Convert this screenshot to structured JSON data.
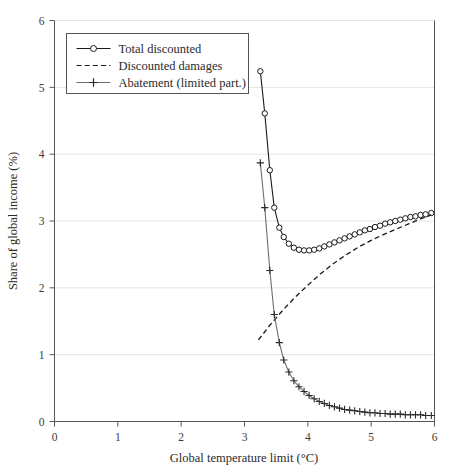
{
  "chart_data": {
    "type": "line",
    "title": "",
    "xlabel": "Global temperature limit (°C)",
    "ylabel": "Share of global income (%)",
    "xlim": [
      0,
      6
    ],
    "ylim": [
      0,
      6
    ],
    "xticks": [
      "0",
      "1",
      "2",
      "3",
      "4",
      "5",
      "6"
    ],
    "xtick_values": [
      0,
      1,
      2,
      3,
      4,
      5,
      6
    ],
    "yticks": [
      "0",
      "1",
      "2",
      "3",
      "4",
      "5",
      "6"
    ],
    "ytick_values": [
      0,
      1,
      2,
      3,
      4,
      5,
      6
    ],
    "grid": "horizontal",
    "legend_position": "top-left",
    "series": [
      {
        "name": "Total discounted",
        "marker": "open-circle",
        "linestyle": "solid",
        "color": "#1a1a1a",
        "x": [
          3.25,
          3.32,
          3.4,
          3.47,
          3.55,
          3.62,
          3.7,
          3.78,
          3.86,
          3.94,
          4.02,
          4.1,
          4.18,
          4.26,
          4.34,
          4.42,
          4.5,
          4.58,
          4.66,
          4.74,
          4.82,
          4.9,
          4.98,
          5.06,
          5.14,
          5.22,
          5.3,
          5.38,
          5.46,
          5.54,
          5.62,
          5.7,
          5.78,
          5.86,
          5.95
        ],
        "y": [
          5.24,
          4.61,
          3.76,
          3.2,
          2.9,
          2.76,
          2.66,
          2.6,
          2.57,
          2.56,
          2.56,
          2.57,
          2.59,
          2.62,
          2.65,
          2.68,
          2.71,
          2.74,
          2.77,
          2.8,
          2.83,
          2.86,
          2.88,
          2.91,
          2.93,
          2.96,
          2.98,
          3.0,
          3.02,
          3.04,
          3.06,
          3.07,
          3.09,
          3.1,
          3.12
        ]
      },
      {
        "name": "Discounted damages",
        "marker": "none",
        "linestyle": "dashed",
        "color": "#1a1a1a",
        "x": [
          3.22,
          3.4,
          3.6,
          3.8,
          4.0,
          4.2,
          4.4,
          4.6,
          4.8,
          5.0,
          5.2,
          5.4,
          5.6,
          5.8,
          5.95
        ],
        "y": [
          1.22,
          1.44,
          1.66,
          1.86,
          2.04,
          2.21,
          2.36,
          2.49,
          2.61,
          2.71,
          2.8,
          2.88,
          2.96,
          3.04,
          3.09
        ]
      },
      {
        "name": "Abatement (limited part.)",
        "marker": "plus",
        "linestyle": "solid",
        "color": "#6e6e6e",
        "x": [
          3.25,
          3.32,
          3.4,
          3.47,
          3.55,
          3.62,
          3.7,
          3.78,
          3.86,
          3.94,
          4.02,
          4.1,
          4.18,
          4.26,
          4.34,
          4.42,
          4.5,
          4.58,
          4.66,
          4.74,
          4.82,
          4.9,
          4.98,
          5.06,
          5.14,
          5.22,
          5.3,
          5.38,
          5.46,
          5.54,
          5.62,
          5.7,
          5.78,
          5.86,
          5.95
        ],
        "y": [
          3.87,
          3.2,
          2.26,
          1.6,
          1.18,
          0.92,
          0.74,
          0.61,
          0.52,
          0.45,
          0.39,
          0.34,
          0.3,
          0.27,
          0.24,
          0.22,
          0.2,
          0.18,
          0.17,
          0.16,
          0.15,
          0.14,
          0.13,
          0.13,
          0.12,
          0.12,
          0.11,
          0.11,
          0.11,
          0.1,
          0.1,
          0.1,
          0.1,
          0.09,
          0.09
        ]
      }
    ],
    "legend": [
      {
        "label": "Total discounted",
        "marker": "open-circle",
        "linestyle": "solid"
      },
      {
        "label": "Discounted damages",
        "marker": "none",
        "linestyle": "dashed"
      },
      {
        "label": "Abatement (limited part.)",
        "marker": "plus",
        "linestyle": "solid"
      }
    ],
    "colors": {
      "axis": "#555555",
      "grid": "#e4e4e4",
      "series_primary": "#1a1a1a",
      "series_abatement": "#6e6e6e",
      "background": "#ffffff"
    }
  }
}
